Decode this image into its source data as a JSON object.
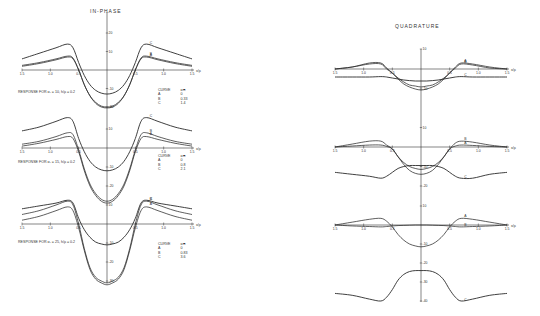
{
  "titles": {
    "left": "IN-PHASE",
    "right": "QUADRATURE"
  },
  "x_axis_label": "x/ρ",
  "colors": {
    "curve": "#2a2a2a",
    "axis": "#333333",
    "background": "#ffffff"
  },
  "chart_data": [
    {
      "type": "line",
      "title": "IN-PHASE",
      "panel": 1,
      "note": "RESPONSE FOR α₁ = 10, h/ρ = 0.2",
      "xlabel": "x/ρ",
      "x_ticks": [
        "1.5",
        "1.0",
        "0.5",
        "0.5",
        "1.0",
        "1.5"
      ],
      "y_ticks": [
        "20",
        "10",
        "-10",
        "-20"
      ],
      "legend": {
        "header": [
          "CURVE",
          "αₘ"
        ],
        "rows": [
          [
            "A",
            "0"
          ],
          [
            "B",
            "0.33"
          ],
          [
            "C",
            "1.4"
          ]
        ]
      },
      "x": [
        -1.5,
        -1.2,
        -0.9,
        -0.7,
        -0.6,
        -0.5,
        -0.4,
        -0.3,
        -0.2,
        -0.1,
        0,
        0.1,
        0.2,
        0.3,
        0.4,
        0.5,
        0.6,
        0.7,
        0.9,
        1.2,
        1.5
      ],
      "series": [
        {
          "name": "A",
          "values": [
            2,
            3.5,
            5.5,
            7,
            6,
            0,
            -8,
            -14,
            -18,
            -20,
            -20.5,
            -20,
            -18,
            -14,
            -8,
            0,
            6,
            7,
            5.5,
            3.5,
            2
          ]
        },
        {
          "name": "B",
          "values": [
            2.5,
            4,
            6,
            7.5,
            6.5,
            0,
            -8,
            -14,
            -17.5,
            -19.5,
            -20,
            -19.5,
            -17.5,
            -14,
            -8,
            0,
            6.5,
            7.5,
            6,
            4,
            2.5
          ]
        },
        {
          "name": "C",
          "values": [
            6,
            9,
            12,
            14,
            12,
            4,
            -3,
            -8,
            -11,
            -12.5,
            -13,
            -12.5,
            -11,
            -8,
            -3,
            4,
            12,
            14,
            12,
            9,
            6
          ]
        }
      ]
    },
    {
      "type": "line",
      "title": "IN-PHASE",
      "panel": 2,
      "note": "RESPONSE FOR α₁ = 15, h/ρ = 0.2",
      "xlabel": "x/ρ",
      "x_ticks": [
        "1.5",
        "1.0",
        "0.5",
        "0.5",
        "1.0",
        "1.5"
      ],
      "y_ticks": [
        "10",
        "-10",
        "-20",
        "-20"
      ],
      "legend": {
        "header": [
          "CURVE",
          "αₘ"
        ],
        "rows": [
          [
            "A",
            "0"
          ],
          [
            "B",
            "0.8"
          ],
          [
            "C",
            "2.1"
          ]
        ]
      },
      "x": [
        -1.5,
        -1.2,
        -0.9,
        -0.7,
        -0.6,
        -0.5,
        -0.4,
        -0.3,
        -0.2,
        -0.1,
        0,
        0.1,
        0.2,
        0.3,
        0.4,
        0.5,
        0.6,
        0.7,
        0.9,
        1.2,
        1.5
      ],
      "series": [
        {
          "name": "A",
          "values": [
            1,
            2.5,
            4.5,
            6,
            5,
            -2,
            -12,
            -20,
            -25,
            -28,
            -29,
            -28,
            -25,
            -20,
            -12,
            -2,
            5,
            6,
            4.5,
            2.5,
            1
          ]
        },
        {
          "name": "B",
          "values": [
            2,
            3.5,
            6,
            8,
            7,
            -1,
            -11,
            -19,
            -24,
            -27,
            -28,
            -27,
            -24,
            -19,
            -11,
            -1,
            7,
            8,
            6,
            3.5,
            2
          ]
        },
        {
          "name": "C",
          "values": [
            9,
            11,
            14,
            16,
            14,
            5,
            -2,
            -7,
            -10,
            -11.5,
            -12,
            -11.5,
            -10,
            -7,
            -2,
            5,
            14,
            16,
            14,
            11,
            9
          ]
        }
      ]
    },
    {
      "type": "line",
      "title": "IN-PHASE",
      "panel": 3,
      "note": "RESPONSE FOR α₁ = 25, h/ρ = 0.2",
      "xlabel": "x/ρ",
      "x_ticks": [
        "1.5",
        "1.0",
        "0.5",
        "0.5",
        "1.0",
        "1.5"
      ],
      "y_ticks": [
        "-30",
        "10",
        "-10",
        "-20",
        "-30"
      ],
      "legend": {
        "header": [
          "CURVE",
          "αₘ"
        ],
        "rows": [
          [
            "A",
            "0"
          ],
          [
            "B",
            "0.83"
          ],
          [
            "C",
            "3.6"
          ]
        ]
      },
      "x": [
        -1.5,
        -1.2,
        -0.9,
        -0.7,
        -0.6,
        -0.5,
        -0.4,
        -0.3,
        -0.2,
        -0.1,
        0,
        0.1,
        0.2,
        0.3,
        0.4,
        0.5,
        0.6,
        0.7,
        0.9,
        1.2,
        1.5
      ],
      "series": [
        {
          "name": "A",
          "values": [
            2,
            4,
            7,
            9,
            7,
            -2,
            -14,
            -24,
            -29,
            -31,
            -32,
            -31,
            -29,
            -24,
            -14,
            -2,
            7,
            9,
            7,
            4,
            2
          ]
        },
        {
          "name": "B",
          "values": [
            5,
            7,
            10,
            12,
            10,
            0,
            -13,
            -23,
            -28,
            -30,
            -31,
            -30,
            -28,
            -23,
            -13,
            0,
            10,
            12,
            10,
            7,
            5
          ]
        },
        {
          "name": "C",
          "values": [
            8,
            9.5,
            11,
            12.5,
            11,
            3,
            -3,
            -7,
            -9.5,
            -10.5,
            -11,
            -10.5,
            -9.5,
            -7,
            -3,
            3,
            11,
            12.5,
            11,
            9.5,
            8
          ]
        }
      ]
    },
    {
      "type": "line",
      "title": "QUADRATURE",
      "panel": 1,
      "xlabel": "x/ρ",
      "x_ticks": [
        "1.5",
        "1.0",
        "0.5",
        "0.5",
        "1.0",
        "1.5"
      ],
      "y_ticks": [
        "10",
        "-10",
        "-10"
      ],
      "x": [
        -1.5,
        -1.2,
        -0.9,
        -0.7,
        -0.6,
        -0.5,
        -0.4,
        -0.3,
        -0.2,
        -0.1,
        0,
        0.1,
        0.2,
        0.3,
        0.4,
        0.5,
        0.6,
        0.7,
        0.9,
        1.2,
        1.5
      ],
      "series": [
        {
          "name": "A",
          "values": [
            0,
            1,
            3,
            3,
            0.5,
            -2,
            -5,
            -7.5,
            -9,
            -10,
            -10.5,
            -10,
            -9,
            -7.5,
            -5,
            -2,
            1,
            3,
            2.5,
            1,
            0
          ]
        },
        {
          "name": "B",
          "values": [
            0,
            1,
            2.5,
            2.5,
            0,
            -2,
            -4.5,
            -6.5,
            -8,
            -8.5,
            -9,
            -8.5,
            -8,
            -6.5,
            -4.5,
            -2,
            0.5,
            2.5,
            2,
            0.5,
            0
          ]
        },
        {
          "name": "C",
          "values": [
            -4,
            -4,
            -4,
            -3.8,
            -4,
            -4.5,
            -5,
            -5.5,
            -5.8,
            -6,
            -6,
            -6,
            -5.8,
            -5.5,
            -5,
            -4.5,
            -4,
            -3.8,
            -4,
            -4,
            -4
          ]
        }
      ]
    },
    {
      "type": "line",
      "title": "QUADRATURE",
      "panel": 2,
      "xlabel": "x/ρ",
      "x_ticks": [
        "1.5",
        "1.0",
        "0.5",
        "0.5",
        "1.0",
        "1.5"
      ],
      "y_ticks": [
        "10",
        "-10",
        "-20",
        "10"
      ],
      "x": [
        -1.5,
        -1.2,
        -0.9,
        -0.7,
        -0.6,
        -0.5,
        -0.4,
        -0.3,
        -0.2,
        -0.1,
        0,
        0.1,
        0.2,
        0.3,
        0.4,
        0.5,
        0.6,
        0.7,
        0.9,
        1.2,
        1.5
      ],
      "series": [
        {
          "name": "A",
          "values": [
            0,
            0.5,
            1,
            1,
            0.3,
            -1,
            -5,
            -8,
            -10,
            -11,
            -11.5,
            -11,
            -10,
            -8,
            -5,
            -1,
            0.5,
            1,
            0.8,
            0.3,
            0
          ]
        },
        {
          "name": "B",
          "values": [
            0,
            1.5,
            3,
            3,
            1,
            -1,
            -5,
            -9,
            -12,
            -13.5,
            -14,
            -13.5,
            -12,
            -9,
            -5,
            -1,
            2,
            3,
            2.5,
            1,
            0
          ]
        },
        {
          "name": "C",
          "values": [
            -13,
            -14,
            -15,
            -16,
            -15,
            -13,
            -11,
            -10,
            -9.5,
            -9.5,
            -9.5,
            -9.5,
            -9.5,
            -10,
            -11,
            -13,
            -15,
            -16,
            -16,
            -14,
            -13
          ]
        }
      ]
    },
    {
      "type": "line",
      "title": "QUADRATURE",
      "panel": 3,
      "xlabel": "x/ρ",
      "x_ticks": [
        "1.5",
        "1.0",
        "0.5",
        "0.5",
        "1.0",
        "1.5"
      ],
      "y_ticks": [
        "10",
        "-10",
        "-20",
        "-30",
        "-40"
      ],
      "x": [
        -1.5,
        -1.2,
        -0.9,
        -0.7,
        -0.6,
        -0.5,
        -0.4,
        -0.3,
        -0.2,
        -0.1,
        0,
        0.1,
        0.2,
        0.3,
        0.4,
        0.5,
        0.6,
        0.7,
        0.9,
        1.2,
        1.5
      ],
      "series": [
        {
          "name": "A",
          "values": [
            0,
            1.5,
            3,
            3.5,
            2,
            -1,
            -5,
            -8,
            -10,
            -11,
            -11.5,
            -11,
            -10,
            -8,
            -5,
            -1,
            2,
            3.5,
            3,
            1.5,
            0
          ]
        },
        {
          "name": "B",
          "values": [
            0,
            -0.5,
            -0.8,
            -1,
            -0.8,
            -0.5,
            -0.3,
            -0.2,
            -0.1,
            0,
            0,
            0,
            -0.1,
            -0.2,
            -0.3,
            -0.5,
            -0.8,
            -1,
            -0.8,
            -0.5,
            0
          ]
        },
        {
          "name": "C",
          "values": [
            -36,
            -37,
            -39,
            -40,
            -38,
            -34,
            -29,
            -26,
            -24.5,
            -24,
            -24,
            -24,
            -24.5,
            -26,
            -29,
            -34,
            -38,
            -40,
            -39,
            -37,
            -36
          ]
        }
      ]
    }
  ],
  "panels_meta": [
    {
      "cx": 107,
      "x0": 22,
      "x1": 192,
      "axis_y": 70,
      "ppu": 1.85,
      "yaxis_top": 12,
      "yaxis_bot": 108,
      "label_x_end": "x/ρ"
    },
    {
      "cx": 107,
      "x0": 22,
      "x1": 192,
      "axis_y": 148,
      "ppu": 1.9,
      "yaxis_top": 108,
      "yaxis_bot": 185,
      "label_x_end": "x/ρ"
    },
    {
      "cx": 107,
      "x0": 22,
      "x1": 192,
      "axis_y": 224,
      "ppu": 1.9,
      "yaxis_top": 185,
      "yaxis_bot": 283,
      "label_x_end": "x/ρ"
    },
    {
      "cx": 421,
      "x0": 335,
      "x1": 507,
      "axis_y": 69,
      "ppu": 2.0,
      "yaxis_top": 49,
      "yaxis_bot": 120,
      "label_x_end": "x/ρ"
    },
    {
      "cx": 421,
      "x0": 335,
      "x1": 507,
      "axis_y": 147,
      "ppu": 1.95,
      "yaxis_top": 120,
      "yaxis_bot": 200,
      "label_x_end": "x/ρ"
    },
    {
      "cx": 421,
      "x0": 335,
      "x1": 507,
      "axis_y": 225,
      "ppu": 1.9,
      "yaxis_top": 200,
      "yaxis_bot": 302,
      "label_x_end": "x/ρ"
    }
  ],
  "tick_labels_y": [
    [
      {
        "t": "20",
        "v": 20
      },
      {
        "t": "10",
        "v": 10
      },
      {
        "t": "-10",
        "v": -10
      },
      {
        "t": "-20",
        "v": -20
      }
    ],
    [
      {
        "t": "10",
        "v": 10
      },
      {
        "t": "-10",
        "v": -10
      },
      {
        "t": "-20",
        "v": -20
      }
    ],
    [
      {
        "t": "10",
        "v": 10
      },
      {
        "t": "-10",
        "v": -10
      },
      {
        "t": "-20",
        "v": -20
      },
      {
        "t": "-30",
        "v": -30
      }
    ],
    [
      {
        "t": "10",
        "v": 10
      },
      {
        "t": "-10",
        "v": -10
      }
    ],
    [
      {
        "t": "10",
        "v": 10
      },
      {
        "t": "-10",
        "v": -10
      },
      {
        "t": "-20",
        "v": -20
      }
    ],
    [
      {
        "t": "10",
        "v": 10
      },
      {
        "t": "-10",
        "v": -10
      },
      {
        "t": "-20",
        "v": -20
      },
      {
        "t": "-30",
        "v": -30
      },
      {
        "t": "-40",
        "v": -40
      }
    ]
  ]
}
